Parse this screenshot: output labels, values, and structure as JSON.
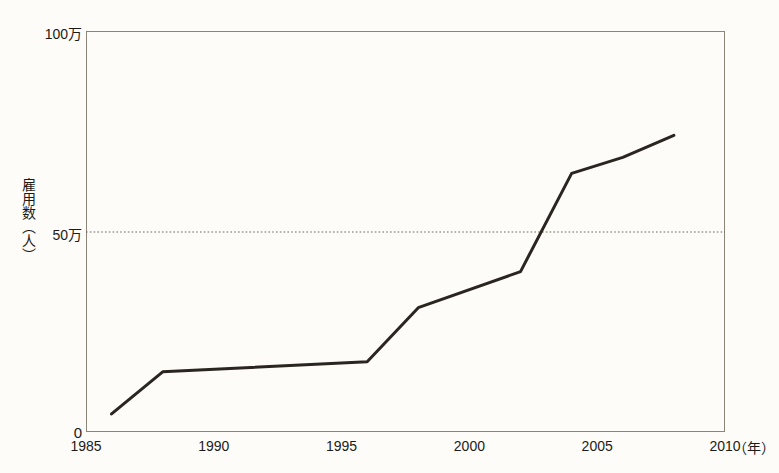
{
  "page": {
    "clipped_header_text": ""
  },
  "chart_data": {
    "type": "line",
    "title": "",
    "xlabel": "年",
    "ylabel": "雇用数（人）",
    "xlim": [
      1985,
      2010
    ],
    "ylim": [
      0,
      1000000
    ],
    "grid": "horizontal-dotted-at-500000",
    "legend": "none",
    "x_ticks": [
      "1985",
      "1990",
      "1995",
      "2000",
      "2005",
      "2010"
    ],
    "x_tick_values": [
      1985,
      1990,
      1995,
      2000,
      2005,
      2010
    ],
    "x_unit_label": "（年）",
    "y_ticks": [
      "0",
      "50万",
      "100万"
    ],
    "y_tick_values": [
      0,
      500000,
      1000000
    ],
    "reference_line": {
      "value": 500000,
      "style": "dotted"
    },
    "series": [
      {
        "name": "雇用数",
        "color": "#2a2520",
        "x": [
          1986,
          1988,
          1996,
          1998,
          2002,
          2004,
          2006,
          2008
        ],
        "values": [
          45000,
          150000,
          175000,
          310000,
          400000,
          645000,
          685000,
          740000
        ]
      }
    ]
  },
  "colors": {
    "line": "#2a2520",
    "frame": "#8d8577",
    "gridline": "#6d655a",
    "background": "#fdfcf9",
    "text": "#1e1a16"
  }
}
